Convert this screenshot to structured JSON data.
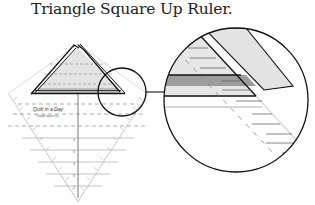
{
  "caption": "Triangle Square Up Ruler.",
  "ruler": {
    "brand_label": "Quilt in a Day",
    "brand_sub": "Triangle Square Up",
    "tick_labels_top": [
      "2½",
      "2",
      "1½",
      "1",
      "½"
    ],
    "tick_labels_bottom": [
      "6",
      "5",
      "4",
      "3",
      "2",
      "1"
    ]
  },
  "colors": {
    "outline": "#111111",
    "shade_light": "#e3e3e3",
    "shade_mid": "#cfcfcf",
    "shade_dark": "#9c9c9c",
    "dash": "#8a8a8a",
    "tick": "#555555"
  }
}
